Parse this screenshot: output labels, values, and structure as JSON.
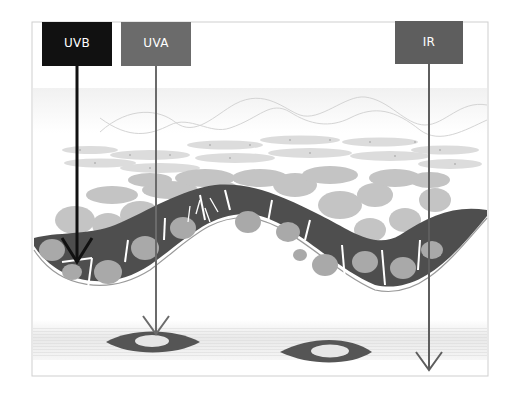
{
  "diagram": {
    "title": "",
    "labels": {
      "uvb": "UVB",
      "uva": "UVA",
      "ir": "IR"
    },
    "colors": {
      "uvb": "#111111",
      "uva": "#6b6b6b",
      "ir": "#5e5e5e",
      "basal_cell": "#4e4e4e",
      "nucleus": "#a9a9a9",
      "upper_cell": "#bdbdbd",
      "stratum_corneum": "#d6d6d6",
      "dermis_band": "#ececec",
      "blood_vessel": "#555555"
    },
    "rays": [
      {
        "name": "UVB",
        "penetration": "epidermis-basal-layer"
      },
      {
        "name": "UVA",
        "penetration": "dermis"
      },
      {
        "name": "IR",
        "penetration": "subcutis"
      }
    ]
  }
}
